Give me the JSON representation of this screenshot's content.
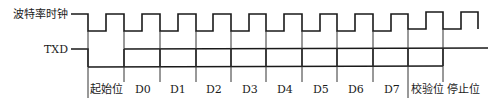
{
  "diagram": {
    "type": "timing-diagram",
    "signals": [
      {
        "name": "baud-clock",
        "label": "波特率时钟"
      },
      {
        "name": "txd",
        "label": "TXD"
      }
    ],
    "bit_labels": [
      "起始位",
      "D0",
      "D1",
      "D2",
      "D3",
      "D4",
      "D5",
      "D6",
      "D7",
      "校验位",
      "停止位"
    ],
    "colors": {
      "line": "#1a1a1a",
      "background": "#ffffff"
    }
  }
}
